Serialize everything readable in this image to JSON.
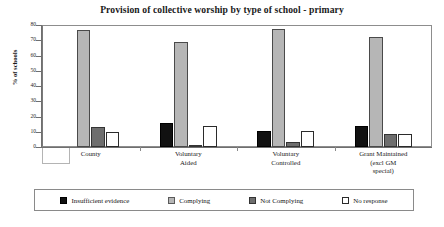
{
  "chart_data": {
    "type": "bar",
    "title": "Provision of collective worship by type of school - primary",
    "xlabel": "",
    "ylabel": "% of schools",
    "ylim": [
      0,
      80
    ],
    "yticks": [
      0,
      10,
      20,
      30,
      40,
      50,
      60,
      70,
      80
    ],
    "grid": false,
    "legend_position": "bottom",
    "categories": [
      "County",
      "Voluntary Aided",
      "Voluntary Controlled",
      "Grant Maintained (excl GM special)"
    ],
    "category_lines": [
      [
        "County"
      ],
      [
        "Voluntary",
        "Aided"
      ],
      [
        "Voluntary",
        "Controlled"
      ],
      [
        "Grant Maintained",
        "(excl GM",
        "special)"
      ]
    ],
    "series": [
      {
        "name": "Insufficient evidence",
        "color": "#111111",
        "values": [
          0,
          16,
          10.5,
          14
        ]
      },
      {
        "name": "Complying",
        "color": "#b6b6b6",
        "values": [
          77,
          69,
          77.5,
          72
        ]
      },
      {
        "name": "Not Complying",
        "color": "#6e6e6e",
        "values": [
          13,
          1.5,
          3.5,
          8.5
        ]
      },
      {
        "name": "No response",
        "color": "#ffffff",
        "values": [
          10,
          14,
          10.5,
          8.5
        ]
      }
    ]
  }
}
